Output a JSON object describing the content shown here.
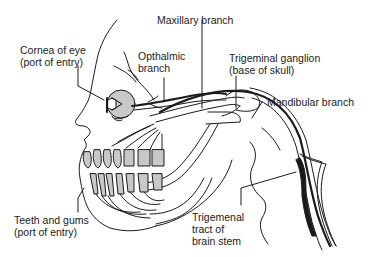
{
  "diagram": {
    "labels": {
      "cornea_line1": "Cornea of eye",
      "cornea_line2": "(port of entry)",
      "opthalmic_line1": "Opthalmic",
      "opthalmic_line2": "branch",
      "maxillary": "Maxillary branch",
      "ganglion_line1": "Trigeminal ganglion",
      "ganglion_line2": "(base of skull)",
      "mandibular": "Mandibular branch",
      "teeth_line1": "Teeth and gums",
      "teeth_line2": "(port of entry)",
      "tract_line1": "Trigemenal",
      "tract_line2": "tract of",
      "tract_line3": "brain stem"
    },
    "colors": {
      "line": "#1a1a1a",
      "fill_gray": "#c8c8c8",
      "background": "#ffffff"
    }
  }
}
